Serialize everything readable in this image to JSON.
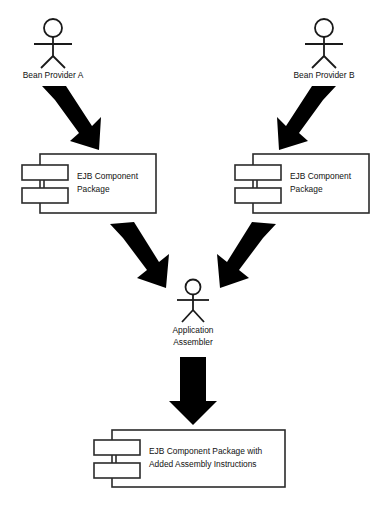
{
  "diagram": {
    "background_color": "#ffffff",
    "line_color": "#2b2b2b",
    "arrow_color": "#000000",
    "text_color": "#111111"
  },
  "actors": {
    "bean_provider_a": {
      "label": "Bean Provider A",
      "icon": "actor-stick-figure"
    },
    "bean_provider_b": {
      "label": "Bean Provider B",
      "icon": "actor-stick-figure"
    },
    "application_assembler": {
      "label_line1": "Application",
      "label_line2": "Assembler",
      "icon": "actor-stick-figure"
    }
  },
  "components": {
    "package_left": {
      "label_line1": "EJB Component",
      "label_line2": "Package",
      "icon": "uml-component-icon"
    },
    "package_right": {
      "label_line1": "EJB Component",
      "label_line2": "Package",
      "icon": "uml-component-icon"
    },
    "package_assembled": {
      "label_line1": "EJB Component Package with",
      "label_line2": "Added Assembly Instructions",
      "icon": "uml-component-icon"
    }
  },
  "arrows": {
    "a_to_package_left": {
      "name": "arrow-down-right",
      "direction": "down-right"
    },
    "b_to_package_right": {
      "name": "arrow-down-left",
      "direction": "down-left"
    },
    "package_left_to_assembler": {
      "name": "arrow-down-right",
      "direction": "down-right"
    },
    "package_right_to_assembler": {
      "name": "arrow-down-left",
      "direction": "down-left"
    },
    "assembler_to_output": {
      "name": "arrow-down",
      "direction": "down"
    }
  }
}
